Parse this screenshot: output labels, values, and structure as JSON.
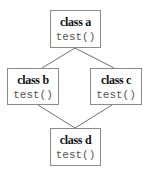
{
  "diagram": {
    "type": "class-inheritance-diamond",
    "nodes": [
      {
        "id": "a",
        "name": "class a",
        "method": "test()"
      },
      {
        "id": "b",
        "name": "class b",
        "method": "test()"
      },
      {
        "id": "c",
        "name": "class c",
        "method": "test()"
      },
      {
        "id": "d",
        "name": "class d",
        "method": "test()"
      }
    ],
    "edges": [
      {
        "from": "a",
        "to": "b"
      },
      {
        "from": "a",
        "to": "c"
      },
      {
        "from": "b",
        "to": "d"
      },
      {
        "from": "c",
        "to": "d"
      }
    ],
    "colors": {
      "border": "#8a8a8a",
      "line": "#707070",
      "name_text": "#111111",
      "method_text": "#555555",
      "background": "#ffffff"
    }
  }
}
